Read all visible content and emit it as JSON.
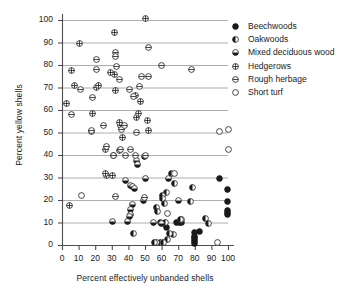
{
  "chart_data": {
    "type": "scatter",
    "title": "",
    "xlabel": "Percent effectively unbanded shells",
    "ylabel": "Percent yellow shells",
    "xlim": [
      0,
      100
    ],
    "ylim": [
      0,
      100
    ],
    "xticks": [
      0,
      10,
      20,
      30,
      40,
      50,
      60,
      70,
      80,
      90,
      100
    ],
    "yticks": [
      0,
      10,
      20,
      30,
      40,
      50,
      60,
      70,
      80,
      90,
      100
    ],
    "grid": "horizontal-every-10-from-10-to-100",
    "legend_position": "right-top-outside",
    "series": [
      {
        "name": "Beechwoods",
        "marker": "filled-circle",
        "points": [
          [
            95,
            29.5
          ],
          [
            99.5,
            24.5
          ],
          [
            99.5,
            19.5
          ],
          [
            99.5,
            15.5
          ],
          [
            99.5,
            14.5
          ],
          [
            99.5,
            13.5
          ],
          [
            80,
            1.5
          ],
          [
            80,
            2.5
          ],
          [
            80,
            0.8
          ],
          [
            80,
            4.0
          ],
          [
            83,
            6.0
          ],
          [
            72,
            10.0
          ],
          [
            70.5,
            10.0
          ],
          [
            69,
            10.0
          ],
          [
            61.5,
            9.5
          ],
          [
            63,
            8.0
          ],
          [
            80,
            5.5
          ],
          [
            80,
            3.2
          ]
        ]
      },
      {
        "name": "Oakwoods",
        "marker": "half-left-filled-circle",
        "points": [
          [
            43,
            5.0
          ],
          [
            63,
            23.5
          ],
          [
            78.5,
            25.5
          ],
          [
            62,
            18.5
          ],
          [
            68,
            27.5
          ],
          [
            66,
            32.0
          ],
          [
            57,
            16.5
          ],
          [
            57.5,
            15.0
          ],
          [
            60.5,
            22.0
          ],
          [
            60.5,
            20.5
          ],
          [
            72,
            11.5
          ],
          [
            71.5,
            11.5
          ],
          [
            67,
            4.5
          ],
          [
            65,
            5.0
          ],
          [
            63.5,
            2.5
          ],
          [
            59.5,
            1.0
          ],
          [
            57,
            1.0
          ],
          [
            56,
            1.0
          ],
          [
            61,
            1.0
          ],
          [
            86.5,
            12.0
          ],
          [
            88,
            9.5
          ],
          [
            77.5,
            19.5
          ],
          [
            62.5,
            10.0
          ],
          [
            59.5,
            10.0
          ]
        ]
      },
      {
        "name": "Mixed deciduous wood",
        "marker": "half-bottom-filled-circle",
        "points": [
          [
            45,
            37.5
          ],
          [
            45.5,
            36.0
          ],
          [
            49.5,
            39.5
          ],
          [
            38.5,
            28.5
          ],
          [
            41.5,
            26.5
          ],
          [
            42.5,
            26.0
          ],
          [
            43.5,
            25.0
          ],
          [
            50,
            29.5
          ],
          [
            42.5,
            18.0
          ],
          [
            41.5,
            16.0
          ],
          [
            41,
            13.5
          ],
          [
            40.5,
            12.5
          ],
          [
            39.5,
            10.5
          ],
          [
            30.5,
            10.5
          ],
          [
            64,
            29.5
          ],
          [
            70,
            20.0
          ],
          [
            49,
            20.0
          ],
          [
            55,
            10.0
          ],
          [
            60,
            9.5
          ]
        ]
      },
      {
        "name": "Hedgerows",
        "marker": "cross-circle",
        "points": [
          [
            50.5,
            100.5
          ],
          [
            31.5,
            94.5
          ],
          [
            10.5,
            89.5
          ],
          [
            5.5,
            77.5
          ],
          [
            7.5,
            71.0
          ],
          [
            20.5,
            70.0
          ],
          [
            18.5,
            58.5
          ],
          [
            31.5,
            76.0
          ],
          [
            29.5,
            76.5
          ],
          [
            32,
            68.5
          ],
          [
            36.5,
            48.0
          ],
          [
            35,
            53.0
          ],
          [
            34.5,
            54.5
          ],
          [
            52,
            51.0
          ],
          [
            51.5,
            55.5
          ],
          [
            45,
            56.5
          ],
          [
            46,
            58.5
          ],
          [
            17.5,
            50.5
          ],
          [
            26,
            42.5
          ],
          [
            31,
            40.0
          ],
          [
            34.5,
            42.0
          ],
          [
            27,
            31.0
          ],
          [
            30.5,
            31.0
          ],
          [
            26.5,
            32.0
          ],
          [
            2.5,
            63.0
          ],
          [
            4.5,
            17.5
          ],
          [
            22,
            71.0
          ],
          [
            47,
            64.0
          ],
          [
            44,
            66.5
          ]
        ]
      },
      {
        "name": "Rough herbage",
        "marker": "hbar-circle",
        "points": [
          [
            20.5,
            82.5
          ],
          [
            20.5,
            78.0
          ],
          [
            32,
            85.5
          ],
          [
            32.5,
            84.0
          ],
          [
            33,
            79.5
          ],
          [
            34.5,
            73.5
          ],
          [
            11,
            69.0
          ],
          [
            18.5,
            65.5
          ],
          [
            5.5,
            58.0
          ],
          [
            17.5,
            51.0
          ],
          [
            25,
            53.0
          ],
          [
            36,
            51.5
          ],
          [
            37.5,
            53.0
          ],
          [
            45,
            50.0
          ],
          [
            27,
            44.0
          ],
          [
            31,
            40.0
          ],
          [
            35,
            42.5
          ],
          [
            38.5,
            40.0
          ],
          [
            41.5,
            42.5
          ],
          [
            44,
            40.0
          ],
          [
            78,
            78.0
          ],
          [
            60,
            80.0
          ],
          [
            48,
            75.0
          ],
          [
            52,
            75.0
          ],
          [
            52,
            88.0
          ],
          [
            46.5,
            70.5
          ],
          [
            40.5,
            69.0
          ],
          [
            43,
            66.0
          ],
          [
            49.5,
            21.0
          ],
          [
            32,
            21.5
          ],
          [
            50,
            40.0
          ]
        ]
      },
      {
        "name": "Short turf",
        "marker": "open-circle",
        "points": [
          [
            95,
            50.5
          ],
          [
            100,
            51.5
          ],
          [
            100,
            42.5
          ],
          [
            11.5,
            22.0
          ],
          [
            63.5,
            14.0
          ],
          [
            93.5,
            1.0
          ],
          [
            68,
            32.0
          ]
        ]
      }
    ]
  },
  "legend": {
    "items": [
      {
        "label": "Beechwoods",
        "marker": "filled-circle"
      },
      {
        "label": "Oakwoods",
        "marker": "half-left-filled-circle"
      },
      {
        "label": "Mixed deciduous wood",
        "marker": "half-bottom-filled-circle"
      },
      {
        "label": "Hedgerows",
        "marker": "cross-circle"
      },
      {
        "label": "Rough herbage",
        "marker": "hbar-circle"
      },
      {
        "label": "Short turf",
        "marker": "open-circle"
      }
    ]
  },
  "colors": {
    "ink": "#1a1a1a",
    "grid": "#999999",
    "axis": "#4d4d4d",
    "background": "#ffffff"
  }
}
